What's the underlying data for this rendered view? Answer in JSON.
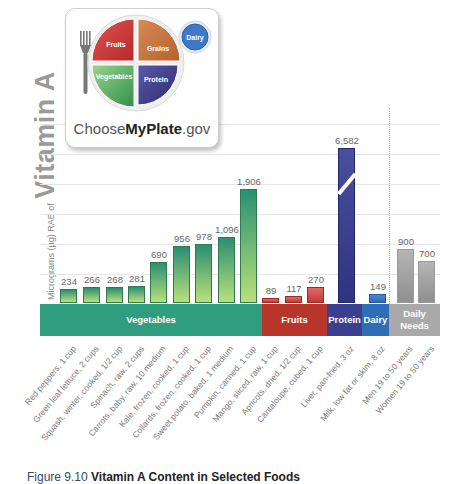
{
  "logo": {
    "plate_sections": {
      "fruits": "Fruits",
      "grains": "Grains",
      "vegetables": "Vegetables",
      "protein": "Protein",
      "dairy": "Dairy"
    },
    "text_prefix": "Choose",
    "text_bold": "MyPlate",
    "text_suffix": ".gov"
  },
  "y_axis": {
    "small_label": "Micrograms (µg) RAE of",
    "big_label": "Vitamin A"
  },
  "caption": {
    "prefix": "Figure 9.10",
    "title": "Vitamin A Content in Selected Foods"
  },
  "colors": {
    "vegetables": "#2e9e7e",
    "fruits": "#c0392b",
    "protein": "#3a3f8f",
    "dairy": "#2f6db5",
    "daily_needs": "#a9a9a9"
  },
  "chart_data": {
    "type": "bar",
    "title": "Vitamin A Content in Selected Foods",
    "xlabel": "",
    "ylabel": "Micrograms (µg) RAE of Vitamin A",
    "grid": true,
    "axis_break": {
      "category": "Liver, pan-fried, 3 oz"
    },
    "groups": [
      {
        "name": "Vegetables",
        "color": "#2e9e7e",
        "categories": [
          "Red peppers, 1 cup",
          "Green leaf lettuce, 2 cups",
          "Squash, winter, cooked, 1/2 cup",
          "Spinach, raw, 2 cups",
          "Carrots, baby, raw, 10 medium",
          "Kale, frozen, cooked, 1 cup",
          "Collards, frozen, cooked, 1 cup",
          "Sweet potato, baked, 1 medium",
          "Pumpkin, canned, 1 cup"
        ],
        "values": [
          234,
          266,
          268,
          281,
          690,
          956,
          978,
          1096,
          1906
        ]
      },
      {
        "name": "Fruits",
        "color": "#c0392b",
        "categories": [
          "Mango, sliced, raw, 1 cup",
          "Apricots, dried, 1/2 cup",
          "Cantaloupe, cubed, 1 cup"
        ],
        "values": [
          89,
          117,
          270
        ]
      },
      {
        "name": "Protein",
        "color": "#3a3f8f",
        "categories": [
          "Liver, pan-fried, 3 oz"
        ],
        "values": [
          6582
        ]
      },
      {
        "name": "Dairy",
        "color": "#2f6db5",
        "categories": [
          "Milk, low fat or skim, 8 oz"
        ],
        "values": [
          149
        ]
      },
      {
        "name": "Daily Needs",
        "color": "#a9a9a9",
        "categories": [
          "Men 19 to 50 years",
          "Women 19 to 50 years"
        ],
        "values": [
          900,
          700
        ]
      }
    ],
    "categories": [
      "Red peppers, 1 cup",
      "Green leaf lettuce, 2 cups",
      "Squash, winter, cooked, 1/2 cup",
      "Spinach, raw, 2 cups",
      "Carrots, baby, raw, 10 medium",
      "Kale, frozen, cooked, 1 cup",
      "Collards, frozen, cooked, 1 cup",
      "Sweet potato, baked, 1 medium",
      "Pumpkin, canned, 1 cup",
      "Mango, sliced, raw, 1 cup",
      "Apricots, dried, 1/2 cup",
      "Cantaloupe, cubed, 1 cup",
      "Liver, pan-fried, 3 oz",
      "Milk, low fat or skim, 8 oz",
      "Men 19 to 50 years",
      "Women 19 to 50 years"
    ],
    "values": [
      234,
      266,
      268,
      281,
      690,
      956,
      978,
      1096,
      1906,
      89,
      117,
      270,
      6582,
      149,
      900,
      700
    ],
    "value_labels": [
      "234",
      "266",
      "268",
      "281",
      "690",
      "956",
      "978",
      "1,096",
      "1,906",
      "89",
      "117",
      "270",
      "6,582",
      "149",
      "900",
      "700"
    ],
    "band_labels": [
      "Vegetables",
      "Fruits",
      "Protein",
      "Dairy",
      "Daily Needs"
    ]
  }
}
